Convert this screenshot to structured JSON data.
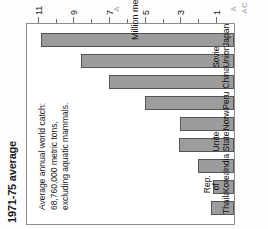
{
  "chart_data": {
    "type": "bar",
    "orientation": "horizontal",
    "title": "1971-75 average",
    "subtitle": "",
    "xlabel": "Million metric tons",
    "ylabel": "",
    "categories": [
      "Thailand",
      "Rep. of\nKorea",
      "India",
      "United States",
      "Norway",
      "Peru",
      "China",
      "Soviet Union",
      "Japan"
    ],
    "values": [
      1.3,
      1.2,
      2.0,
      3.1,
      3.0,
      5.0,
      7.0,
      8.6,
      10.8
    ],
    "xlim": [
      0,
      11.6
    ],
    "ticks": [
      1,
      3,
      5,
      7,
      9,
      11
    ],
    "minor_ticks": [
      2,
      4,
      6,
      8,
      10
    ],
    "tick_labels": [
      "1",
      "3",
      "5",
      "7",
      "9",
      "11"
    ],
    "grid": false,
    "legend": "none",
    "annotation": "Average annual world catch:\n68,760,000 metric tons,\nexcluding aquatic mammals.",
    "bar_color": "#9c9c9c",
    "bar_border_color": "#555555",
    "frame_color": "#8d8d8d",
    "background": "#ffffff"
  },
  "page_bleed": {
    "fragment_a": "A",
    "fragment_b": "A",
    "fragment_c": "AC"
  }
}
